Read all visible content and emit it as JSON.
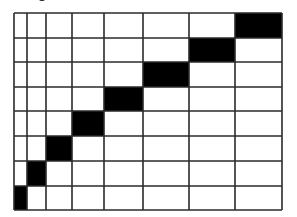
{
  "diagram": {
    "type": "staircase-grid",
    "rows": 8,
    "cols": 8,
    "col_edges": [
      14,
      27,
      46,
      72,
      104,
      143,
      189,
      235,
      282
    ],
    "row_edges": [
      13,
      38,
      62,
      87,
      111,
      136,
      161,
      186,
      210
    ],
    "filled_cells": [
      {
        "row": 0,
        "col": 7
      },
      {
        "row": 1,
        "col": 6
      },
      {
        "row": 2,
        "col": 5
      },
      {
        "row": 3,
        "col": 4
      },
      {
        "row": 4,
        "col": 3
      },
      {
        "row": 5,
        "col": 2
      },
      {
        "row": 6,
        "col": 1
      },
      {
        "row": 7,
        "col": 0
      }
    ],
    "colors": {
      "line": "#2a2a2a",
      "fill": "#000000",
      "background": "#ffffff"
    },
    "line_width": 1.6
  }
}
